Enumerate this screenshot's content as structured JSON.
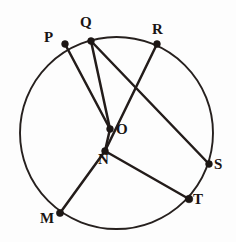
{
  "figure": {
    "type": "geometry-diagram",
    "canvas": {
      "width": 236,
      "height": 242,
      "background": "#ffffff"
    },
    "stroke_color": "#231c1a",
    "circle": {
      "name": "main-circle",
      "center_x": 116.5,
      "center_y": 133,
      "radius": 96,
      "stroke_width": 1.9
    },
    "points": [
      {
        "id": "P",
        "label": "P",
        "x": 65,
        "y": 44,
        "on_circle": true
      },
      {
        "id": "Q",
        "label": "Q",
        "x": 91,
        "y": 41,
        "on_circle": true
      },
      {
        "id": "R",
        "label": "R",
        "x": 157,
        "y": 44,
        "on_circle": true
      },
      {
        "id": "S",
        "label": "S",
        "x": 209,
        "y": 164,
        "on_circle": true
      },
      {
        "id": "T",
        "label": "T",
        "x": 189,
        "y": 199,
        "on_circle": true
      },
      {
        "id": "M",
        "label": "M",
        "x": 60,
        "y": 213,
        "on_circle": true
      },
      {
        "id": "O",
        "label": "O",
        "x": 110,
        "y": 129,
        "on_circle": false
      },
      {
        "id": "N",
        "label": "N",
        "x": 105,
        "y": 151,
        "on_circle": false
      }
    ],
    "segments": [
      {
        "id": "PO",
        "from": "P",
        "to": "O",
        "path": "65,44 110,129"
      },
      {
        "id": "ON",
        "from": "O",
        "to": "N",
        "path": "110,129 105,151"
      },
      {
        "id": "NM",
        "from": "N",
        "to": "M",
        "path": "105,151 60,213"
      },
      {
        "id": "QO",
        "from": "Q",
        "to": "O",
        "path": "91,41 110,129"
      },
      {
        "id": "QS",
        "from": "Q",
        "to": "S",
        "path": "91,41 209,164"
      },
      {
        "id": "RN",
        "from": "R",
        "to": "N",
        "path": "157,44 105,151"
      },
      {
        "id": "NT",
        "from": "N",
        "to": "T",
        "path": "105,151 189,199"
      }
    ]
  }
}
